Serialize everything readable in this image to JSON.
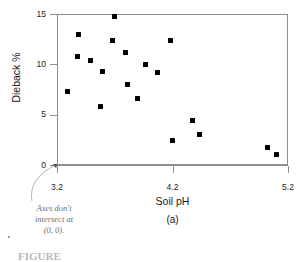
{
  "chart_data": {
    "type": "scatter",
    "title": "",
    "xlabel": "Soil pH",
    "ylabel": "Dieback %",
    "panel_label": "(a)",
    "xlim": [
      3.2,
      5.2
    ],
    "ylim": [
      0,
      15
    ],
    "xticks": [
      3.2,
      4.2,
      5.2
    ],
    "xtick_labels": [
      "3.2",
      "4.2",
      "5.2"
    ],
    "yticks": [
      0,
      5,
      10,
      15
    ],
    "ytick_labels": [
      "0",
      "5",
      "10",
      "15"
    ],
    "grid": false,
    "legend": null,
    "marker": "filled-square",
    "marker_color": "#000000",
    "n_points": 19,
    "x": [
      3.29,
      3.38,
      3.39,
      3.49,
      3.58,
      3.59,
      3.68,
      3.7,
      3.79,
      3.81,
      3.9,
      3.97,
      4.07,
      4.18,
      4.2,
      4.37,
      4.43,
      5.02,
      5.1
    ],
    "y": [
      7.3,
      10.8,
      13.0,
      10.4,
      5.8,
      9.3,
      12.4,
      14.8,
      11.2,
      8.0,
      6.6,
      10.0,
      9.2,
      12.4,
      2.4,
      4.4,
      3.0,
      1.7,
      1.0
    ],
    "points": [
      {
        "x": 3.29,
        "y": 7.3
      },
      {
        "x": 3.38,
        "y": 10.8
      },
      {
        "x": 3.39,
        "y": 13.0
      },
      {
        "x": 3.49,
        "y": 10.4
      },
      {
        "x": 3.58,
        "y": 5.8
      },
      {
        "x": 3.59,
        "y": 9.3
      },
      {
        "x": 3.68,
        "y": 12.4
      },
      {
        "x": 3.7,
        "y": 14.8
      },
      {
        "x": 3.79,
        "y": 11.2
      },
      {
        "x": 3.81,
        "y": 8.0
      },
      {
        "x": 3.9,
        "y": 6.6
      },
      {
        "x": 3.97,
        "y": 10.0
      },
      {
        "x": 4.07,
        "y": 9.2
      },
      {
        "x": 4.18,
        "y": 12.4
      },
      {
        "x": 4.2,
        "y": 2.4
      },
      {
        "x": 4.37,
        "y": 4.4
      },
      {
        "x": 4.43,
        "y": 3.0
      },
      {
        "x": 5.02,
        "y": 1.7
      },
      {
        "x": 5.1,
        "y": 1.0
      }
    ],
    "annotations": [
      {
        "name": "axes-break-note",
        "line1": "Axes don't",
        "line2": "intersect at",
        "line3": "(0, 0).",
        "text": "Axes don't intersect at (0, 0).",
        "color": "#6e6e6e",
        "style": "italic",
        "points_to": "origin"
      }
    ]
  },
  "axes": {
    "frame_color": "#8e8e8e",
    "y_title": "Dieback %",
    "x_title": "Soil pH"
  },
  "caption": {
    "text": "FIGURE"
  }
}
